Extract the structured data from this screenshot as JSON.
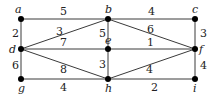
{
  "diagram": {
    "type": "weighted-graph",
    "nodes": [
      {
        "id": "a",
        "label": "a",
        "x": 21,
        "y": 19,
        "lx": 15,
        "ly": 13
      },
      {
        "id": "b",
        "label": "b",
        "x": 108,
        "y": 19,
        "lx": 105,
        "ly": 13
      },
      {
        "id": "c",
        "label": "c",
        "x": 195,
        "y": 19,
        "lx": 192,
        "ly": 13
      },
      {
        "id": "d",
        "label": "d",
        "x": 21,
        "y": 49,
        "lx": 9,
        "ly": 53
      },
      {
        "id": "e",
        "label": "e",
        "x": 108,
        "y": 49,
        "lx": 105,
        "ly": 44
      },
      {
        "id": "f",
        "label": "f",
        "x": 195,
        "y": 49,
        "lx": 199,
        "ly": 53
      },
      {
        "id": "g",
        "label": "g",
        "x": 21,
        "y": 79,
        "lx": 18,
        "ly": 92
      },
      {
        "id": "h",
        "label": "h",
        "x": 108,
        "y": 79,
        "lx": 105,
        "ly": 92
      },
      {
        "id": "i",
        "label": "i",
        "x": 195,
        "y": 79,
        "lx": 193,
        "ly": 92
      }
    ],
    "edges": [
      {
        "from": "a",
        "to": "b",
        "weight": "5",
        "wx": 60,
        "wy": 15
      },
      {
        "from": "b",
        "to": "c",
        "weight": "4",
        "wx": 148,
        "wy": 15
      },
      {
        "from": "a",
        "to": "d",
        "weight": "2",
        "wx": 12,
        "wy": 37
      },
      {
        "from": "d",
        "to": "b",
        "weight": "3",
        "wx": 56,
        "wy": 35
      },
      {
        "from": "b",
        "to": "e",
        "weight": "5",
        "wx": 99,
        "wy": 37
      },
      {
        "from": "b",
        "to": "f",
        "weight": "6",
        "wx": 147,
        "wy": 33
      },
      {
        "from": "c",
        "to": "f",
        "weight": "3",
        "wx": 200,
        "wy": 37
      },
      {
        "from": "d",
        "to": "e",
        "weight": "7",
        "wx": 60,
        "wy": 46
      },
      {
        "from": "e",
        "to": "f",
        "weight": "1",
        "wx": 147,
        "wy": 46
      },
      {
        "from": "d",
        "to": "g",
        "weight": "6",
        "wx": 12,
        "wy": 69
      },
      {
        "from": "d",
        "to": "h",
        "weight": "8",
        "wx": 60,
        "wy": 73
      },
      {
        "from": "e",
        "to": "h",
        "weight": "3",
        "wx": 99,
        "wy": 68
      },
      {
        "from": "h",
        "to": "f",
        "weight": "4",
        "wx": 146,
        "wy": 73
      },
      {
        "from": "f",
        "to": "i",
        "weight": "4",
        "wx": 200,
        "wy": 69
      },
      {
        "from": "g",
        "to": "h",
        "weight": "4",
        "wx": 60,
        "wy": 91
      },
      {
        "from": "h",
        "to": "i",
        "weight": "2",
        "wx": 151,
        "wy": 91
      }
    ]
  }
}
